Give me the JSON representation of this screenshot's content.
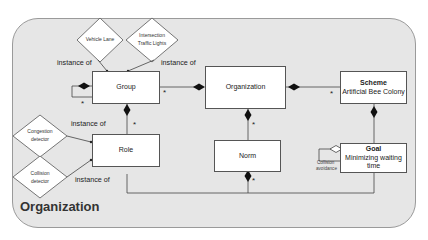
{
  "diagram": {
    "container_title": "Organization",
    "entities": {
      "group": {
        "title": "Group"
      },
      "organization": {
        "title": "Organization"
      },
      "scheme": {
        "title": "Scheme",
        "subtitle": "Artificial Bee Colony"
      },
      "role": {
        "title": "Role"
      },
      "norm": {
        "title": "Norm"
      },
      "goal": {
        "title": "Goal",
        "subtitle": "Minimizing waiting time"
      }
    },
    "instances": {
      "vehicle_lane": "Vehicle Lane",
      "intersection_line1": "Intersection",
      "intersection_line2": "Traffic Lights",
      "congestion_line1": "Congestion",
      "congestion_line2": "detector",
      "collision_line1": "Collision",
      "collision_line2": "detector"
    },
    "relation_labels": {
      "instance_of_1": "instance of",
      "instance_of_2": "instance of",
      "instance_of_3": "instance of",
      "instance_of_4": "instance of"
    },
    "multiplicity": "*",
    "self_loop_label_line1": "Collision",
    "self_loop_label_line2": "avoidance"
  }
}
